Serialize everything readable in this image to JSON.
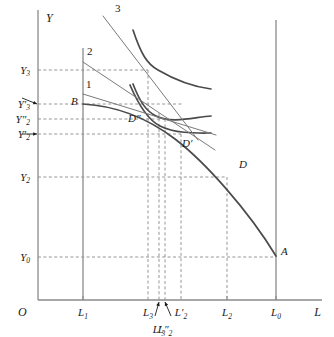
{
  "figure": {
    "type": "economics-diagram",
    "axes": {
      "y_axis_label": "Y",
      "x_axis_label": "L",
      "origin_label": "O"
    },
    "y_ticks": [
      {
        "id": "Y3",
        "label": "Y",
        "sub": "3",
        "prime": "",
        "y": 70,
        "arrow": false
      },
      {
        "id": "Y3p",
        "label": "Y",
        "sub": "3",
        "prime": "′",
        "y": 104,
        "arrow": true
      },
      {
        "id": "Y2pp",
        "label": "Y",
        "sub": "2",
        "prime": "″",
        "y": 119,
        "arrow": false
      },
      {
        "id": "Y2p",
        "label": "Y",
        "sub": "2",
        "prime": "′",
        "y": 134,
        "arrow": true
      },
      {
        "id": "Y2",
        "label": "Y",
        "sub": "2",
        "prime": "",
        "y": 177,
        "arrow": false
      },
      {
        "id": "Y0",
        "label": "Y",
        "sub": "0",
        "prime": "",
        "y": 257,
        "arrow": false
      }
    ],
    "x_ticks": [
      {
        "id": "L1",
        "label": "L",
        "sub": "1",
        "prime": "",
        "x": 83,
        "row": 1,
        "arrow": false
      },
      {
        "id": "L3",
        "label": "L",
        "sub": "3",
        "prime": "",
        "x": 148,
        "row": 1,
        "arrow": false
      },
      {
        "id": "L3p",
        "label": "L",
        "sub": "3",
        "prime": "′",
        "x": 159,
        "row": 2,
        "arrow": true
      },
      {
        "id": "L2pp",
        "label": "L",
        "sub": "2",
        "prime": "″",
        "x": 165,
        "row": 2,
        "arrow": true
      },
      {
        "id": "L2p",
        "label": "L",
        "sub": "2",
        "prime": "′",
        "x": 181,
        "row": 1,
        "arrow": false
      },
      {
        "id": "L2",
        "label": "L",
        "sub": "2",
        "prime": "",
        "x": 227,
        "row": 1,
        "arrow": false
      },
      {
        "id": "L0",
        "label": "L",
        "sub": "0",
        "prime": "",
        "x": 276,
        "row": 1,
        "arrow": false
      }
    ],
    "point_labels": [
      {
        "id": "A",
        "text": "A",
        "x": 281,
        "y": 255
      },
      {
        "id": "B",
        "text": "B",
        "x": 71,
        "y": 105
      },
      {
        "id": "D",
        "text": "D",
        "x": 239,
        "y": 168
      },
      {
        "id": "Dp",
        "text": "D′",
        "x": 182,
        "y": 147
      },
      {
        "id": "Dpp",
        "text": "D″",
        "x": 128,
        "y": 122
      }
    ],
    "curve_labels": [
      {
        "id": "c1",
        "text": "1",
        "x": 86,
        "y": 88
      },
      {
        "id": "c2",
        "text": "2",
        "x": 87,
        "y": 55
      },
      {
        "id": "c3",
        "text": "3",
        "x": 115,
        "y": 12
      }
    ],
    "colors": {
      "axis": "#8a8a8a",
      "curve": "#4a4a4a",
      "thin_line": "#7a7a7a",
      "dashed": "#8a8a8a",
      "text": "#1a1a1a"
    }
  },
  "chart_data": {
    "type": "line",
    "title": "",
    "xlabel": "L",
    "ylabel": "Y",
    "grid": false,
    "legend_position": "none",
    "axis_pixel_frame": {
      "x0": 38,
      "y0": 300,
      "x_end": 322,
      "y_top": 10
    },
    "vertical_reference_lines": [
      {
        "name": "L1",
        "x": 83,
        "y_from": 300,
        "y_to": 48
      },
      {
        "name": "L0",
        "x": 276,
        "y_from": 300,
        "y_to": 20
      }
    ],
    "series": [
      {
        "name": "transformation-curve-BA",
        "kind": "curve",
        "stroke": "#4a4a4a",
        "width": 1.7,
        "path": "M 83,104 C 120,106 150,120 175,139 C 205,162 248,210 276,256"
      },
      {
        "name": "indifference-curve-3",
        "kind": "curve",
        "stroke": "#4a4a4a",
        "width": 1.7,
        "path": "M 133,30 C 141,54 147,64 158,70 C 175,80 195,87 211,89"
      },
      {
        "name": "indifference-curve-2",
        "kind": "curve",
        "stroke": "#4a4a4a",
        "width": 1.7,
        "path": "M 133,84 C 140,102 146,111 156,116 C 172,124 195,117 211,116"
      },
      {
        "name": "indifference-curve-1",
        "kind": "curve",
        "stroke": "#4a4a4a",
        "width": 1.7,
        "path": "M 130,85 C 139,106 148,120 160,126 C 176,134 198,133 211,133"
      },
      {
        "name": "budget-line-3",
        "kind": "line",
        "stroke": "#7a7a7a",
        "width": 1.0,
        "path": "M 103,16 L 198,140"
      },
      {
        "name": "budget-line-2",
        "kind": "line",
        "stroke": "#7a7a7a",
        "width": 1.0,
        "path": "M 83,62 L 215,150"
      },
      {
        "name": "budget-line-1",
        "kind": "line",
        "stroke": "#7a7a7a",
        "width": 1.0,
        "path": "M 83,94 L 216,135"
      }
    ],
    "dashed_horizontals": [
      {
        "name": "Y3-line",
        "y": 70,
        "x_from": 38,
        "x_to": 148
      },
      {
        "name": "Y3p-line",
        "y": 104,
        "x_from": 38,
        "x_to": 183
      },
      {
        "name": "Y2pp-line",
        "y": 119,
        "x_from": 38,
        "x_to": 165
      },
      {
        "name": "Y2p-line",
        "y": 134,
        "x_from": 38,
        "x_to": 181
      },
      {
        "name": "Y2-line",
        "y": 177,
        "x_from": 38,
        "x_to": 227
      },
      {
        "name": "Y0-line",
        "y": 257,
        "x_from": 38,
        "x_to": 276
      }
    ],
    "dashed_verticals": [
      {
        "name": "L3-line",
        "x": 148,
        "y_from": 70,
        "y_to": 300
      },
      {
        "name": "L3p-line",
        "x": 159,
        "y_from": 113,
        "y_to": 300
      },
      {
        "name": "L2pp-line",
        "x": 165,
        "y_from": 119,
        "y_to": 300
      },
      {
        "name": "L2p-line",
        "x": 181,
        "y_from": 134,
        "y_to": 300
      },
      {
        "name": "L2-line",
        "x": 227,
        "y_from": 177,
        "y_to": 300
      }
    ]
  }
}
